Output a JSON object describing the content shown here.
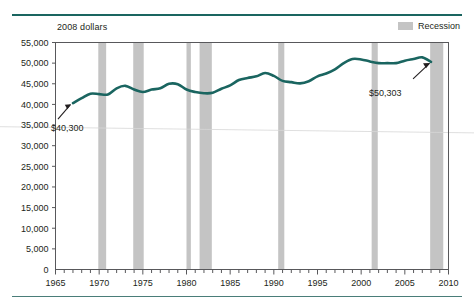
{
  "header": {
    "subtitle": "2008 dollars"
  },
  "legend": {
    "position": "top-right",
    "entries": [
      {
        "label": "Recession",
        "swatch_color": "#c4c4c4",
        "icon": "legend-swatch-icon"
      }
    ]
  },
  "colors": {
    "line": "#1a6560",
    "rule": "#1a6560",
    "recession_band": "#c4c4c4",
    "axis": "#58585b",
    "text": "#231f20"
  },
  "chart_data": {
    "type": "line",
    "title": "",
    "subtitle": "2008 dollars",
    "xlabel": "",
    "ylabel": "",
    "xlim": [
      1965,
      2010
    ],
    "ylim": [
      0,
      55000
    ],
    "ytick_step": 5000,
    "xtick_step": 5,
    "xtick_minor_step": 1,
    "grid": false,
    "yticks": [
      "0",
      "5,000",
      "10,000",
      "15,000",
      "20,000",
      "25,000",
      "30,000",
      "35,000",
      "40,000",
      "45,000",
      "50,000",
      "55,000"
    ],
    "xticks": [
      "1965",
      "1970",
      "1975",
      "1980",
      "1985",
      "1990",
      "1995",
      "2000",
      "2005",
      "2010"
    ],
    "series": [
      {
        "name": "Median household income",
        "color": "#1a6560",
        "x": [
          1967,
          1968,
          1969,
          1970,
          1971,
          1972,
          1973,
          1974,
          1975,
          1976,
          1977,
          1978,
          1979,
          1980,
          1981,
          1982,
          1983,
          1984,
          1985,
          1986,
          1987,
          1988,
          1989,
          1990,
          1991,
          1992,
          1993,
          1994,
          1995,
          1996,
          1997,
          1998,
          1999,
          2000,
          2001,
          2002,
          2003,
          2004,
          2005,
          2006,
          2007,
          2008
        ],
        "values": [
          40300,
          41500,
          42600,
          42500,
          42400,
          43900,
          44500,
          43600,
          43000,
          43600,
          43900,
          45000,
          44900,
          43600,
          43000,
          42700,
          42800,
          43800,
          44600,
          45900,
          46400,
          46800,
          47600,
          46900,
          45700,
          45400,
          45100,
          45600,
          46800,
          47500,
          48500,
          50000,
          51000,
          50900,
          50400,
          50000,
          50000,
          50000,
          50600,
          51000,
          51400,
          50303
        ]
      }
    ],
    "annotations": [
      {
        "text": "$40,300",
        "x": 1967,
        "y": 40300,
        "placement": "below-left",
        "arrow": true
      },
      {
        "text": "$50,303",
        "x": 2008,
        "y": 50303,
        "placement": "below-left",
        "arrow": true
      }
    ],
    "recession_bands": [
      {
        "start": 1969.9,
        "end": 1970.8
      },
      {
        "start": 1973.9,
        "end": 1975.1
      },
      {
        "start": 1980.0,
        "end": 1980.5
      },
      {
        "start": 1981.5,
        "end": 1982.9
      },
      {
        "start": 1990.5,
        "end": 1991.2
      },
      {
        "start": 2001.2,
        "end": 2001.9
      },
      {
        "start": 2007.9,
        "end": 2009.4
      }
    ]
  }
}
